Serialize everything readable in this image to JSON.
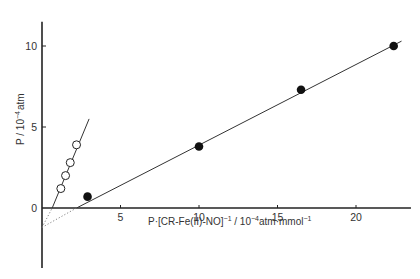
{
  "chart_data": {
    "type": "scatter",
    "title": "",
    "xlabel": "P·[CR-Fe(II)-NO]⁻¹ / 10⁻⁴atm·mmol⁻¹",
    "xlabel_parts": {
      "main": "P·[CR-Fe(II)-NO]",
      "sup1": "−1",
      "mid": " / 10",
      "sup2": "−4",
      "unit": "atm·mmol",
      "sup3": "−1"
    },
    "ylabel": "P / 10⁻⁴ atm",
    "ylabel_parts": {
      "main": "P / 10",
      "sup": "−4",
      "unit": "atm"
    },
    "xlim": [
      0,
      23.5
    ],
    "ylim": [
      -3.7,
      11.5
    ],
    "x_ticks": [
      5,
      10,
      15,
      20
    ],
    "y_ticks": [
      0,
      5,
      10
    ],
    "x_tick_labels": [
      "5",
      "10",
      "15",
      "20"
    ],
    "y_tick_labels": [
      "0",
      "5",
      "10"
    ],
    "grid": false,
    "legend": null,
    "series": [
      {
        "name": "open-circles",
        "marker": "open-circle",
        "points": [
          {
            "x": 1.2,
            "y": 1.2
          },
          {
            "x": 1.5,
            "y": 2.0
          },
          {
            "x": 1.8,
            "y": 2.8
          },
          {
            "x": 2.2,
            "y": 3.9
          }
        ],
        "fit_line": {
          "from": [
            0.65,
            0
          ],
          "to": [
            3.0,
            5.5
          ]
        },
        "extrapolation": {
          "from": [
            0,
            -1.2
          ],
          "to": [
            0.65,
            0
          ]
        }
      },
      {
        "name": "filled-circles",
        "marker": "filled-circle",
        "points": [
          {
            "x": 2.9,
            "y": 0.7
          },
          {
            "x": 10.0,
            "y": 3.8
          },
          {
            "x": 16.5,
            "y": 7.3
          },
          {
            "x": 22.4,
            "y": 10.0
          }
        ],
        "fit_line": {
          "from": [
            2.2,
            0
          ],
          "to": [
            22.9,
            10.3
          ]
        },
        "extrapolation": {
          "from": [
            0,
            -1.2
          ],
          "to": [
            2.2,
            0
          ]
        }
      }
    ]
  }
}
